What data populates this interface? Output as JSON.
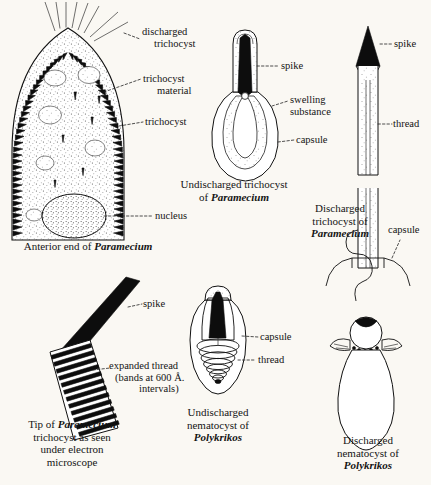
{
  "plate": {
    "title": "Trichocysts and nematocysts plate",
    "background_color": "#faf8f3",
    "ink_color": "#111111"
  },
  "panels": [
    {
      "id": "anterior-end-paramecium",
      "caption_line1": "Anterior end of ",
      "caption_species": "Paramecium",
      "labels": [
        {
          "name": "discharged-trichocyst",
          "line1": "discharged",
          "line2": "trichocyst"
        },
        {
          "name": "trichocyst-material",
          "line1": "trichocyst",
          "line2": "material"
        },
        {
          "name": "trichocyst",
          "line1": "trichocyst",
          "line2": ""
        },
        {
          "name": "nucleus",
          "line1": "nucleus",
          "line2": ""
        }
      ]
    },
    {
      "id": "undischarged-trichocyst-paramecium",
      "caption_line1": "Undischarged trichocyst",
      "caption_line2": "of ",
      "caption_species": "Paramecium",
      "labels": [
        {
          "name": "spike",
          "line1": "spike",
          "line2": ""
        },
        {
          "name": "swelling-substance",
          "line1": "swelling",
          "line2": "substance"
        },
        {
          "name": "capsule",
          "line1": "capsule",
          "line2": ""
        }
      ]
    },
    {
      "id": "discharged-trichocyst-paramecium",
      "caption_line1": "Discharged",
      "caption_line2": "trichocyst of",
      "caption_species": "Paramecium",
      "labels": [
        {
          "name": "spike",
          "line1": "spike",
          "line2": ""
        },
        {
          "name": "thread",
          "line1": "thread",
          "line2": ""
        },
        {
          "name": "capsule",
          "line1": "capsule",
          "line2": ""
        }
      ]
    },
    {
      "id": "trichocyst-tip-electron-microscope",
      "caption_line1": "Tip of ",
      "caption_species": "Paramecium",
      "caption_line2": "trichocyst as seen",
      "caption_line3": "under electron",
      "caption_line4": "microscope",
      "labels": [
        {
          "name": "spike",
          "line1": "spike",
          "line2": ""
        },
        {
          "name": "expanded-thread",
          "line1": "expanded thread",
          "line2": "(bands at 600 Å.",
          "line3": "intervals)"
        }
      ]
    },
    {
      "id": "undischarged-nematocyst-polykrikos",
      "caption_line1": "Undischarged",
      "caption_line2": "nematocyst of",
      "caption_species": "Polykrikos",
      "labels": [
        {
          "name": "capsule",
          "line1": "capsule",
          "line2": ""
        },
        {
          "name": "thread",
          "line1": "thread",
          "line2": ""
        }
      ]
    },
    {
      "id": "discharged-nematocyst-polykrikos",
      "caption_line1": "Discharged",
      "caption_line2": "nematocyst of",
      "caption_species": "Polykrikos",
      "labels": []
    }
  ]
}
